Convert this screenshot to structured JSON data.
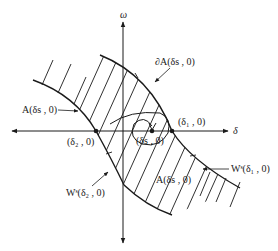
{
  "diagram": {
    "title": "",
    "axes": {
      "x_label": "δ",
      "y_label": "ω"
    },
    "points": [
      {
        "id": "delta2",
        "label": "(δ₂ , 0)",
        "px": [
          96,
          131
        ]
      },
      {
        "id": "delta1",
        "label": "(δ₁ , 0)",
        "px": [
          172,
          131
        ]
      },
      {
        "id": "deltas",
        "label": "(δs , 0)",
        "px": [
          152,
          131
        ]
      }
    ],
    "labels": {
      "region_left": "A(δs , 0)",
      "boundary": "∂A(δs , 0)",
      "region_right": "A(δs , 0)",
      "stable_manifold_2": "Wˢ(δ₂ , 0)",
      "stable_manifold_1": "Wˢ(δ₁ , 0)",
      "point_delta2": "(δ₂ , 0)",
      "point_delta1": "(δ₁ , 0)",
      "point_deltas": "(δs , 0)",
      "axis_delta": "δ",
      "axis_omega": "ω"
    },
    "colors": {
      "stroke": "#1a1a1a",
      "background": "#ffffff"
    }
  }
}
